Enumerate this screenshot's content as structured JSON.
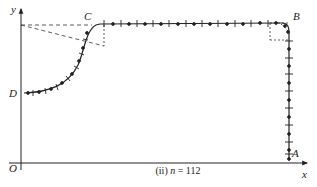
{
  "diagram": {
    "caption": "(ii) n = 112",
    "caption_prefix": "(ii) ",
    "caption_var": "n",
    "caption_value": " = 112",
    "points": {
      "origin": "O",
      "A": "A",
      "B": "B",
      "C": "C",
      "D": "D"
    },
    "axes": {
      "x_label": "x",
      "y_label": "y"
    },
    "colors": {
      "line": "#222222",
      "background": "#ffffff"
    }
  }
}
